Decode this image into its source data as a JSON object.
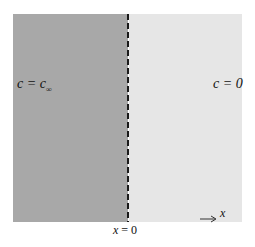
{
  "diagram": {
    "left_region": {
      "label_var": "c",
      "label_eq": " = ",
      "label_rhs": "c",
      "label_sub": "∞",
      "color": "#a8a8a8"
    },
    "right_region": {
      "label": "c = 0",
      "color": "#e6e6e6"
    },
    "boundary": {
      "style": "dashed",
      "color": "#1a1a1a"
    },
    "axis": {
      "label": "x",
      "icon": "arrow-right-icon"
    },
    "origin": {
      "var": "x",
      "text": " = 0"
    }
  }
}
